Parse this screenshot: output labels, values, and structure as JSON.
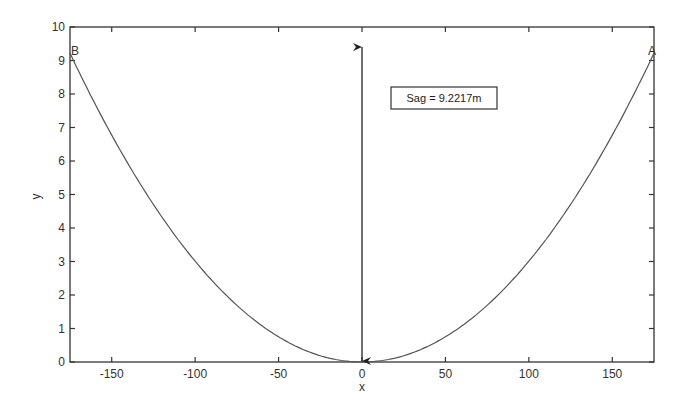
{
  "chart_data": {
    "type": "line",
    "title": "",
    "xlabel": "x",
    "ylabel": "y",
    "xlim": [
      -175,
      175
    ],
    "ylim": [
      0,
      10
    ],
    "xticks": [
      -150,
      -100,
      -50,
      0,
      50,
      100,
      150
    ],
    "yticks": [
      0,
      1,
      2,
      3,
      4,
      5,
      6,
      7,
      8,
      9,
      10
    ],
    "grid": false,
    "legend": null,
    "series": [
      {
        "name": "catenary",
        "description": "symmetric cable sag curve, minimum at (0,0), reaching y≈9.22 at x=±175",
        "x": [
          -175,
          -150,
          -125,
          -100,
          -75,
          -50,
          -25,
          0,
          25,
          50,
          75,
          100,
          125,
          150,
          175
        ],
        "y": [
          9.22,
          6.77,
          4.7,
          3.01,
          1.69,
          0.75,
          0.19,
          0,
          0.19,
          0.75,
          1.69,
          3.01,
          4.7,
          6.77,
          9.22
        ],
        "color": "#555555"
      }
    ],
    "annotations": [
      {
        "type": "point-label",
        "text": "B",
        "x": -175,
        "y": 9.22
      },
      {
        "type": "point-label",
        "text": "A",
        "x": 175,
        "y": 9.22
      },
      {
        "type": "double-arrow",
        "x": 0,
        "y_from": 0,
        "y_to": 9.4
      },
      {
        "type": "textbox",
        "text": "Sag = 9.2217m",
        "x": 55,
        "y": 8.2
      }
    ]
  }
}
